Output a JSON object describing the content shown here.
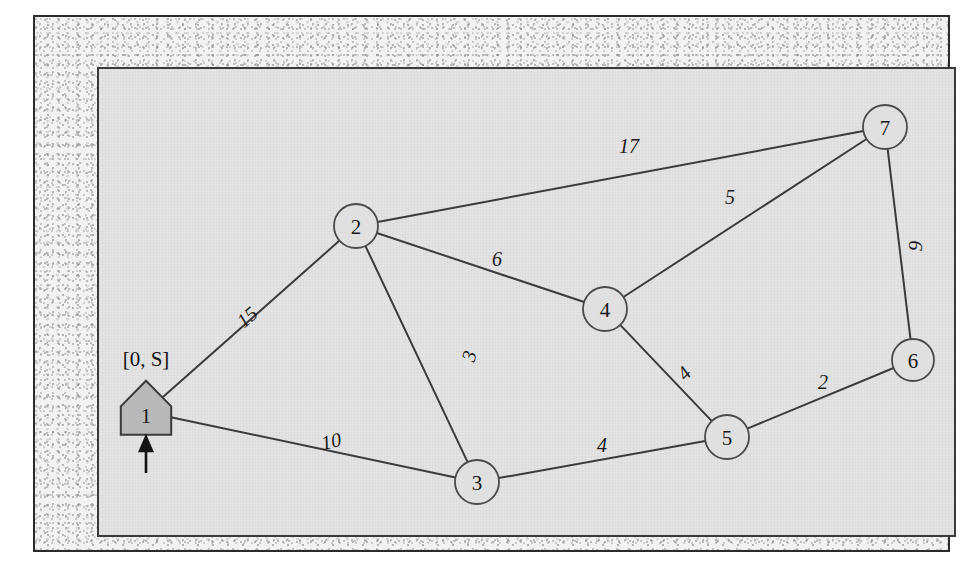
{
  "figure": {
    "panel_background": "#e3e3e3",
    "frame_border_color": "#2b2b2b",
    "edge_color": "#3b3b3b",
    "node_fill": "#e0e0e0",
    "source_node_fill": "#b9b9b9"
  },
  "annotations": {
    "source_label": "[0, S]",
    "source_arrow": "up-arrow"
  },
  "chart_data": {
    "type": "diagram",
    "title": "",
    "nodes": [
      {
        "id": "1",
        "label": "1",
        "shape": "house",
        "x": 47,
        "y": 343,
        "r": 24,
        "fill": "#b9b9b9",
        "is_source": true
      },
      {
        "id": "2",
        "label": "2",
        "shape": "circle",
        "x": 257,
        "y": 157,
        "r": 22,
        "fill": "#e0e0e0",
        "is_source": false
      },
      {
        "id": "3",
        "label": "3",
        "shape": "circle",
        "x": 378,
        "y": 413,
        "r": 22,
        "fill": "#e0e0e0",
        "is_source": false
      },
      {
        "id": "4",
        "label": "4",
        "shape": "circle",
        "x": 506,
        "y": 240,
        "r": 22,
        "fill": "#e0e0e0",
        "is_source": false
      },
      {
        "id": "5",
        "label": "5",
        "shape": "circle",
        "x": 628,
        "y": 368,
        "r": 22,
        "fill": "#e0e0e0",
        "is_source": false
      },
      {
        "id": "6",
        "label": "6",
        "shape": "circle",
        "x": 814,
        "y": 291,
        "r": 21,
        "fill": "#e0e0e0",
        "is_source": false
      },
      {
        "id": "7",
        "label": "7",
        "shape": "circle",
        "x": 786,
        "y": 58,
        "r": 22,
        "fill": "#e0e0e0",
        "is_source": false
      }
    ],
    "edges": [
      {
        "from": "1",
        "to": "2",
        "weight": 15,
        "label": "15",
        "lx": 148,
        "ly": 248,
        "rotate": -41
      },
      {
        "from": "1",
        "to": "3",
        "weight": 10,
        "label": "10",
        "lx": 232,
        "ly": 372,
        "rotate": -12
      },
      {
        "from": "2",
        "to": "7",
        "weight": 17,
        "label": "17",
        "lx": 530,
        "ly": 77,
        "rotate": 0
      },
      {
        "from": "2",
        "to": "4",
        "weight": 6,
        "label": "6",
        "lx": 398,
        "ly": 190,
        "rotate": 0
      },
      {
        "from": "2",
        "to": "3",
        "weight": 3,
        "label": "3",
        "lx": 370,
        "ly": 287,
        "rotate": -74
      },
      {
        "from": "4",
        "to": "7",
        "weight": 5,
        "label": "5",
        "lx": 631,
        "ly": 128,
        "rotate": 0
      },
      {
        "from": "4",
        "to": "5",
        "weight": 4,
        "label": "4",
        "lx": 585,
        "ly": 304,
        "rotate": -46
      },
      {
        "from": "3",
        "to": "5",
        "weight": 4,
        "label": "4",
        "lx": 503,
        "ly": 376,
        "rotate": 0
      },
      {
        "from": "5",
        "to": "6",
        "weight": 2,
        "label": "2",
        "lx": 724,
        "ly": 313,
        "rotate": 0
      },
      {
        "from": "6",
        "to": "7",
        "weight": 9,
        "label": "9",
        "lx": 816,
        "ly": 177,
        "rotate": -86
      }
    ],
    "node_count": 7,
    "edge_count": 10,
    "source_node": "1",
    "legend": [],
    "xlabel": "",
    "ylabel": ""
  }
}
